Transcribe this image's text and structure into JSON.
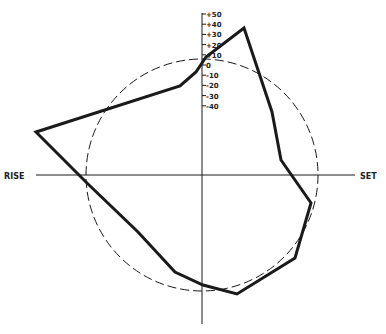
{
  "diagram": {
    "type": "polar-profile",
    "labels": {
      "left": "RISE",
      "right": "SET"
    },
    "scale_ticks": [
      "+50",
      "+40",
      "+30",
      "+20",
      "+10",
      "0",
      "-10",
      "-20",
      "-30",
      "-40"
    ],
    "colors": {
      "ink": "#1a1a1a",
      "background": "#ffffff"
    },
    "axes": {
      "vertical": {
        "x": 202,
        "y1": 13,
        "y2": 324
      },
      "horizontal": {
        "y": 175,
        "x1": 36,
        "x2": 355
      }
    },
    "reference_circle": {
      "cx": 202,
      "cy": 175,
      "r": 116,
      "style": "dashed"
    },
    "profile_polygon": [
      [
        244,
        28
      ],
      [
        272,
        112
      ],
      [
        281,
        160
      ],
      [
        311,
        203
      ],
      [
        295,
        258
      ],
      [
        237,
        294
      ],
      [
        203,
        285
      ],
      [
        175,
        272
      ],
      [
        138,
        232
      ],
      [
        88,
        184
      ],
      [
        36,
        132
      ],
      [
        180,
        86
      ],
      [
        196,
        72
      ],
      [
        206,
        57
      ]
    ]
  }
}
